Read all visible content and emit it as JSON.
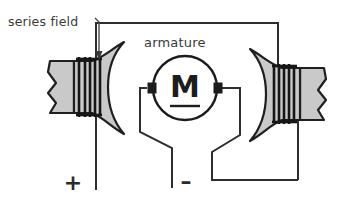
{
  "diagram": {
    "type": "electrical-schematic",
    "labels": {
      "series_field": "series field",
      "armature": "armature",
      "positive_terminal": "+",
      "negative_terminal": "–",
      "motor_symbol": "M"
    },
    "colors": {
      "background": "#ffffff",
      "wire": "#2e2e2e",
      "pole_fill": "#c9c9c9",
      "pole_outline": "#1f1f1f",
      "coil": "#161616",
      "text": "#3a3a3a",
      "motor_outline": "#1c1c1c"
    },
    "components": [
      {
        "name": "left-field-pole",
        "kind": "magnet-pole-piece",
        "side": "left"
      },
      {
        "name": "left-series-coil",
        "kind": "winding",
        "turns": 5
      },
      {
        "name": "right-field-pole",
        "kind": "magnet-pole-piece",
        "side": "right"
      },
      {
        "name": "right-series-coil",
        "kind": "winding",
        "turns": 5
      },
      {
        "name": "armature-motor",
        "kind": "motor-symbol",
        "symbol": "M"
      },
      {
        "name": "top-connecting-wire",
        "kind": "conductor"
      },
      {
        "name": "positive-lead",
        "kind": "terminal",
        "polarity": "+"
      },
      {
        "name": "negative-lead",
        "kind": "terminal",
        "polarity": "–"
      }
    ]
  }
}
